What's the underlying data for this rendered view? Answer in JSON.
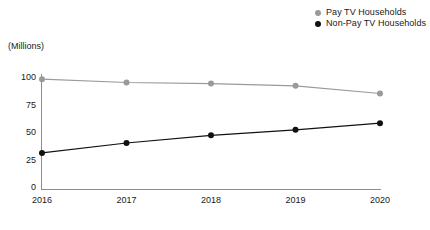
{
  "chart_data": {
    "type": "line",
    "title": "",
    "subtitle": "",
    "xlabel": "",
    "ylabel": "(Millions)",
    "categories": [
      "2016",
      "2017",
      "2018",
      "2019",
      "2020"
    ],
    "x": [
      2016,
      2017,
      2018,
      2019,
      2020
    ],
    "ylim": [
      0,
      100
    ],
    "yticks": [
      0,
      25,
      50,
      75,
      100
    ],
    "ytick_labels": [
      "0",
      "25",
      "50",
      "75",
      "100"
    ],
    "grid": false,
    "legend_position": "top-right",
    "series": [
      {
        "name": "Pay TV Households",
        "color": "#9a9a9a",
        "marker": "circle",
        "values": [
          98,
          95,
          94,
          92,
          85
        ]
      },
      {
        "name": "Non-Pay TV Households",
        "color": "#111111",
        "marker": "circle",
        "values": [
          31,
          40,
          47,
          52,
          58
        ]
      }
    ]
  },
  "legend": {
    "items": [
      {
        "label": "Pay TV Households",
        "color": "#9a9a9a"
      },
      {
        "label": "Non-Pay TV Households",
        "color": "#111111"
      }
    ]
  },
  "axes": {
    "unit_label": "(Millions)",
    "axis_color": "#8c8c8c"
  }
}
